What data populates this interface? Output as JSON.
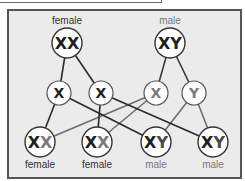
{
  "diagram": {
    "colors": {
      "maternal": "#1e1e1e",
      "paternal": "#7a7a7a",
      "frame_bg": "#ebebeb",
      "frame_border": "#555555",
      "node_fill": "#ffffff"
    },
    "parents": [
      {
        "id": "mother",
        "label": "female",
        "genotype": "XX",
        "letters": [
          "X",
          "X"
        ]
      },
      {
        "id": "father",
        "label": "male",
        "genotype": "XY",
        "letters": [
          "X",
          "Y"
        ]
      }
    ],
    "gametes": [
      {
        "id": "g1",
        "letter": "X",
        "from": "mother"
      },
      {
        "id": "g2",
        "letter": "X",
        "from": "mother"
      },
      {
        "id": "g3",
        "letter": "X",
        "from": "father"
      },
      {
        "id": "g4",
        "letter": "Y",
        "from": "father"
      }
    ],
    "offspring": [
      {
        "id": "o1",
        "genotype": "XX",
        "first": "X",
        "second": "X",
        "label": "female"
      },
      {
        "id": "o2",
        "genotype": "XX",
        "first": "X",
        "second": "X",
        "label": "female"
      },
      {
        "id": "o3",
        "genotype": "XY",
        "first": "X",
        "second": "Y",
        "label": "male"
      },
      {
        "id": "o4",
        "genotype": "XY",
        "first": "X",
        "second": "Y",
        "label": "male"
      }
    ],
    "edges": [
      {
        "from": "mother",
        "to": "g1"
      },
      {
        "from": "mother",
        "to": "g2"
      },
      {
        "from": "father",
        "to": "g3"
      },
      {
        "from": "father",
        "to": "g4"
      },
      {
        "from": "g1",
        "to": "o1"
      },
      {
        "from": "g1",
        "to": "o3"
      },
      {
        "from": "g2",
        "to": "o2"
      },
      {
        "from": "g2",
        "to": "o4"
      },
      {
        "from": "g3",
        "to": "o1"
      },
      {
        "from": "g3",
        "to": "o2"
      },
      {
        "from": "g4",
        "to": "o3"
      },
      {
        "from": "g4",
        "to": "o4"
      }
    ]
  }
}
